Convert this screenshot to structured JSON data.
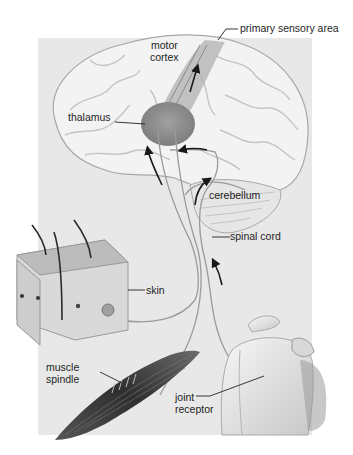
{
  "diagram": {
    "type": "anatomical sensory pathway illustration",
    "background_color": "#e8e8e8",
    "labels": {
      "primary_sensory_area": "primary sensory area",
      "motor_cortex_line1": "motor",
      "motor_cortex_line2": "cortex",
      "thalamus": "thalamus",
      "cerebellum": "cerebellum",
      "spinal_cord": "spinal cord",
      "skin": "skin",
      "muscle_spindle_line1": "muscle",
      "muscle_spindle_line2": "spindle",
      "joint_receptor_line1": "joint",
      "joint_receptor_line2": "receptor"
    },
    "structures": [
      "brain",
      "thalamus",
      "cerebellum",
      "spinal cord",
      "skin block",
      "muscle",
      "shoulder joint"
    ],
    "colors": {
      "brain": "#f2f2f2",
      "brain_outline": "#a8a8a8",
      "thalamus": "#8c8c8c",
      "nerve": "#9a9a9a",
      "arrow": "#1a1a1a",
      "muscle": "#3a3a3a",
      "bone": "#f0f0f0"
    }
  }
}
